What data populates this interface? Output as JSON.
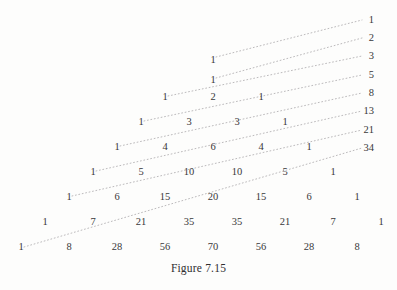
{
  "figure": {
    "caption": "Figure 7.15",
    "ink_color": "#39383a",
    "dot_color": "#b4b2b4",
    "background_color": "#fdfdfc"
  },
  "chart_data": {
    "type": "table",
    "title": "Figure 7.15",
    "xlabel": "",
    "ylabel": "",
    "grid": false,
    "legend": false,
    "rows": [
      {
        "n": 0,
        "values": [
          1
        ]
      },
      {
        "n": 1,
        "values": [
          1,
          1
        ]
      },
      {
        "n": 2,
        "values": [
          1,
          2,
          1
        ]
      },
      {
        "n": 3,
        "values": [
          1,
          3,
          3,
          1
        ]
      },
      {
        "n": 4,
        "values": [
          1,
          4,
          6,
          4,
          1
        ]
      },
      {
        "n": 5,
        "values": [
          1,
          5,
          10,
          10,
          5,
          1
        ]
      },
      {
        "n": 6,
        "values": [
          1,
          6,
          15,
          20,
          15,
          6,
          1
        ]
      },
      {
        "n": 7,
        "values": [
          1,
          7,
          21,
          35,
          35,
          21,
          7,
          1
        ]
      },
      {
        "n": 8,
        "values": [
          1,
          8,
          28,
          56,
          70,
          56,
          28,
          8
        ]
      }
    ],
    "fibonacci_labels": [
      1,
      2,
      3,
      5,
      8,
      13,
      21,
      34
    ],
    "cells": [
      {
        "text": "1",
        "x": 213,
        "y": 60
      },
      {
        "text": "1",
        "x": 213,
        "y": 80
      },
      {
        "text": "1",
        "x": 165,
        "y": 97
      },
      {
        "text": "2",
        "x": 213,
        "y": 97
      },
      {
        "text": "1",
        "x": 261,
        "y": 97
      },
      {
        "text": "1",
        "x": 141,
        "y": 122
      },
      {
        "text": "3",
        "x": 189,
        "y": 122
      },
      {
        "text": "3",
        "x": 237,
        "y": 122
      },
      {
        "text": "1",
        "x": 285,
        "y": 122
      },
      {
        "text": "1",
        "x": 117,
        "y": 147
      },
      {
        "text": "4",
        "x": 165,
        "y": 147
      },
      {
        "text": "6",
        "x": 213,
        "y": 147
      },
      {
        "text": "4",
        "x": 261,
        "y": 147
      },
      {
        "text": "1",
        "x": 309,
        "y": 147
      },
      {
        "text": "1",
        "x": 93,
        "y": 172
      },
      {
        "text": "5",
        "x": 141,
        "y": 172
      },
      {
        "text": "10",
        "x": 189,
        "y": 172
      },
      {
        "text": "10",
        "x": 237,
        "y": 172
      },
      {
        "text": "5",
        "x": 285,
        "y": 172
      },
      {
        "text": "1",
        "x": 333,
        "y": 172
      },
      {
        "text": "1",
        "x": 69,
        "y": 197
      },
      {
        "text": "6",
        "x": 117,
        "y": 197
      },
      {
        "text": "15",
        "x": 165,
        "y": 197
      },
      {
        "text": "20",
        "x": 213,
        "y": 197
      },
      {
        "text": "15",
        "x": 261,
        "y": 197
      },
      {
        "text": "6",
        "x": 309,
        "y": 197
      },
      {
        "text": "1",
        "x": 357,
        "y": 197
      },
      {
        "text": "1",
        "x": 45,
        "y": 222
      },
      {
        "text": "7",
        "x": 93,
        "y": 222
      },
      {
        "text": "21",
        "x": 141,
        "y": 222
      },
      {
        "text": "35",
        "x": 189,
        "y": 222
      },
      {
        "text": "35",
        "x": 237,
        "y": 222
      },
      {
        "text": "21",
        "x": 285,
        "y": 222
      },
      {
        "text": "7",
        "x": 333,
        "y": 222
      },
      {
        "text": "1",
        "x": 381,
        "y": 222
      },
      {
        "text": "1",
        "x": 21,
        "y": 247
      },
      {
        "text": "8",
        "x": 69,
        "y": 247
      },
      {
        "text": "28",
        "x": 117,
        "y": 247
      },
      {
        "text": "56",
        "x": 165,
        "y": 247
      },
      {
        "text": "70",
        "x": 213,
        "y": 247
      },
      {
        "text": "56",
        "x": 261,
        "y": 247
      },
      {
        "text": "28",
        "x": 309,
        "y": 247
      },
      {
        "text": "8",
        "x": 357,
        "y": 247
      }
    ],
    "fib_cells": [
      {
        "text": "1",
        "x": 374,
        "y": 20
      },
      {
        "text": "2",
        "x": 374,
        "y": 38
      },
      {
        "text": "3",
        "x": 374,
        "y": 56
      },
      {
        "text": "5",
        "x": 374,
        "y": 75
      },
      {
        "text": "8",
        "x": 374,
        "y": 93
      },
      {
        "text": "13",
        "x": 374,
        "y": 111
      },
      {
        "text": "21",
        "x": 374,
        "y": 130
      },
      {
        "text": "34",
        "x": 374,
        "y": 148
      }
    ],
    "diagonals": [
      {
        "sum": 1,
        "x1": 216,
        "y1": 57,
        "x2": 362,
        "y2": 20
      },
      {
        "sum": 2,
        "x1": 216,
        "y1": 78,
        "x2": 362,
        "y2": 38
      },
      {
        "sum": 3,
        "x1": 168,
        "y1": 96,
        "x2": 362,
        "y2": 56
      },
      {
        "sum": 5,
        "x1": 144,
        "y1": 121,
        "x2": 362,
        "y2": 75
      },
      {
        "sum": 8,
        "x1": 120,
        "y1": 146,
        "x2": 362,
        "y2": 93
      },
      {
        "sum": 13,
        "x1": 96,
        "y1": 171,
        "x2": 362,
        "y2": 111
      },
      {
        "sum": 21,
        "x1": 72,
        "y1": 196,
        "x2": 362,
        "y2": 130
      },
      {
        "sum": 34,
        "x1": 24,
        "y1": 247,
        "x2": 362,
        "y2": 148
      }
    ]
  }
}
